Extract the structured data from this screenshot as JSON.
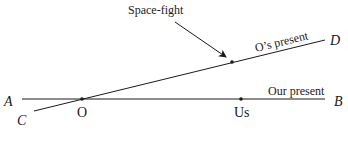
{
  "diagram": {
    "callout": "Space-fight",
    "lines": {
      "ab": {
        "label": "Our present",
        "start_label": "A",
        "end_label": "B"
      },
      "cd": {
        "label": "O’s present",
        "start_label": "C",
        "end_label": "D"
      }
    },
    "points": {
      "o": "O",
      "us": "Us"
    },
    "colors": {
      "ink": "#1a1a1a",
      "background": "#ffffff"
    }
  }
}
